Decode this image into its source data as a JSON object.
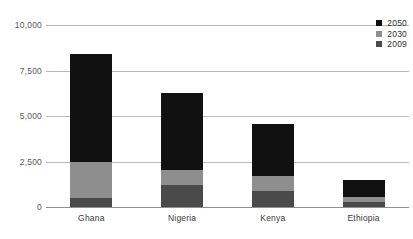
{
  "chart_data": {
    "type": "bar",
    "subtype": "stacked-vertical",
    "title": "",
    "xlabel": "",
    "ylabel": "",
    "categories": [
      "Ghana",
      "Nigeria",
      "Kenya",
      "Ethiopia"
    ],
    "series": [
      {
        "name": "2009",
        "color": "#4a4a4a",
        "values": [
          500,
          1200,
          900,
          280
        ]
      },
      {
        "name": "2030",
        "color": "#8e8e8e",
        "values": [
          2000,
          850,
          800,
          270
        ]
      },
      {
        "name": "2050",
        "color": "#111111",
        "values": [
          5900,
          4200,
          2850,
          950
        ]
      }
    ],
    "cumulative_totals": {
      "note": "segment tops as read from the axis",
      "2009": [
        500,
        1200,
        900,
        280
      ],
      "2030": [
        2500,
        2050,
        1700,
        550
      ],
      "2050": [
        8400,
        6250,
        4550,
        1500
      ]
    },
    "ylim": [
      0,
      10000
    ],
    "yticks": [
      0,
      2500,
      5000,
      7500,
      10000
    ],
    "ytick_labels": [
      "0",
      "2,500",
      "5,000",
      "7,500",
      "10,000"
    ],
    "grid": true,
    "grid_axis": "y",
    "legend_position": "top-right",
    "legend_order": [
      "2050",
      "2030",
      "2009"
    ]
  },
  "axis": {
    "y_ticks": [
      {
        "label": "10,000",
        "value": 10000
      },
      {
        "label": "7,500",
        "value": 7500
      },
      {
        "label": "5,000",
        "value": 5000
      },
      {
        "label": "2,500",
        "value": 2500
      },
      {
        "label": "0",
        "value": 0
      }
    ]
  },
  "legend": {
    "items": [
      {
        "label": "2050",
        "color": "#111111"
      },
      {
        "label": "2030",
        "color": "#8e8e8e"
      },
      {
        "label": "2009",
        "color": "#4a4a4a"
      }
    ]
  },
  "colors": {
    "gridline": "#b9b9b9",
    "baseline": "#8f8f8f",
    "tick_text": "#58585a",
    "category_text": "#3a3a3c",
    "background": "#ffffff"
  }
}
